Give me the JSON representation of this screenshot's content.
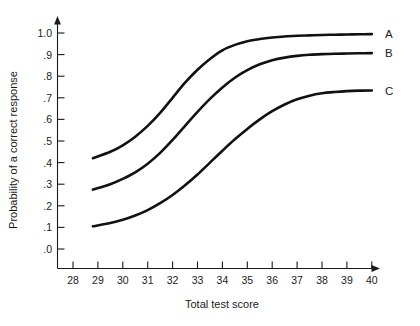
{
  "chart_data": {
    "type": "line",
    "title": "",
    "xlabel": "Total test score",
    "ylabel": "Probability of a correct response",
    "xlim": [
      28,
      40
    ],
    "ylim": [
      0.0,
      1.0
    ],
    "grid": false,
    "legend_position": "right-end-of-curve",
    "xticks": [
      "28",
      "29",
      "30",
      "31",
      "32",
      "33",
      "34",
      "35",
      "36",
      "37",
      "38",
      "39",
      "40"
    ],
    "xtick_values": [
      28,
      29,
      30,
      31,
      32,
      33,
      34,
      35,
      36,
      37,
      38,
      39,
      40
    ],
    "yticks": [
      ".0",
      ".1",
      ".2",
      ".3",
      ".4",
      ".5",
      ".6",
      ".7",
      ".8",
      ".9",
      "1.0"
    ],
    "ytick_values": [
      0.0,
      0.1,
      0.2,
      0.3,
      0.4,
      0.5,
      0.6,
      0.7,
      0.8,
      0.9,
      1.0
    ],
    "x": [
      28.8,
      29.5,
      30,
      30.5,
      31,
      31.5,
      32,
      32.5,
      33,
      33.5,
      34,
      34.5,
      35,
      35.5,
      36,
      36.5,
      37,
      37.5,
      38,
      38.5,
      39,
      39.5,
      40
    ],
    "series": [
      {
        "name": "A",
        "label": "A",
        "color": "#111111",
        "values": [
          0.42,
          0.45,
          0.48,
          0.52,
          0.57,
          0.63,
          0.7,
          0.77,
          0.83,
          0.88,
          0.92,
          0.945,
          0.962,
          0.972,
          0.979,
          0.984,
          0.987,
          0.989,
          0.991,
          0.992,
          0.993,
          0.994,
          0.995
        ]
      },
      {
        "name": "B",
        "label": "B",
        "color": "#111111",
        "values": [
          0.275,
          0.3,
          0.325,
          0.355,
          0.395,
          0.445,
          0.505,
          0.57,
          0.635,
          0.695,
          0.748,
          0.793,
          0.828,
          0.855,
          0.874,
          0.886,
          0.894,
          0.899,
          0.902,
          0.904,
          0.905,
          0.906,
          0.907
        ]
      },
      {
        "name": "C",
        "label": "C",
        "color": "#111111",
        "values": [
          0.105,
          0.12,
          0.135,
          0.155,
          0.18,
          0.212,
          0.25,
          0.295,
          0.345,
          0.4,
          0.455,
          0.508,
          0.556,
          0.6,
          0.638,
          0.669,
          0.693,
          0.71,
          0.721,
          0.727,
          0.731,
          0.733,
          0.734
        ]
      }
    ],
    "axis_style": {
      "x_arrow": true,
      "y_arrow": true,
      "line_color": "#1a1a1a"
    }
  }
}
